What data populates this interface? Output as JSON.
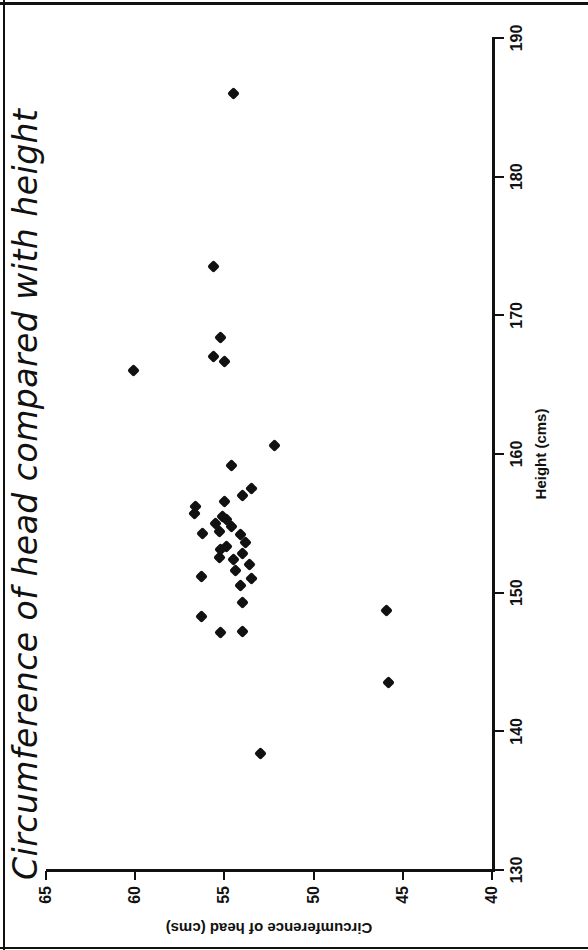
{
  "figure": {
    "title": "Circumference of head compared with height"
  },
  "chart_data": {
    "type": "scatter",
    "title": "Circumference of head compared with height",
    "xlabel": "Height (cms)",
    "ylabel": "Circumference of head (cms)",
    "xlim": [
      130,
      190
    ],
    "ylim": [
      40,
      65
    ],
    "xticks": [
      130,
      140,
      150,
      160,
      170,
      180,
      190
    ],
    "yticks": [
      40,
      45,
      50,
      55,
      60,
      65
    ],
    "grid": false,
    "legend": null,
    "marker": "diamond",
    "marker_color": "#111111",
    "n_points": 37,
    "x": [
      138.4,
      143.5,
      147.1,
      147.2,
      148.3,
      148.7,
      149.3,
      150.5,
      151.0,
      151.2,
      151.6,
      152.0,
      152.4,
      152.5,
      152.8,
      153.1,
      153.3,
      153.6,
      154.2,
      154.3,
      154.4,
      154.8,
      155.0,
      155.3,
      155.5,
      155.7,
      156.2,
      156.6,
      157.0,
      157.5,
      159.2,
      160.6,
      166.0,
      166.7,
      167.0,
      168.4,
      173.5,
      186.0
    ],
    "y": [
      53.0,
      45.8,
      55.2,
      54.0,
      56.3,
      45.9,
      54.0,
      54.1,
      53.5,
      56.3,
      54.4,
      53.6,
      54.5,
      55.3,
      54.0,
      55.2,
      54.9,
      53.8,
      54.1,
      56.2,
      55.3,
      54.6,
      55.5,
      54.9,
      55.1,
      56.7,
      56.6,
      55.0,
      54.0,
      53.5,
      54.6,
      52.2,
      60.1,
      55.0,
      55.6,
      55.2,
      55.6,
      54.5
    ],
    "points": [
      {
        "x": 138.4,
        "y": 53.0
      },
      {
        "x": 143.5,
        "y": 45.8
      },
      {
        "x": 147.1,
        "y": 55.2
      },
      {
        "x": 147.2,
        "y": 54.0
      },
      {
        "x": 148.3,
        "y": 56.3
      },
      {
        "x": 148.7,
        "y": 45.9
      },
      {
        "x": 149.3,
        "y": 54.0
      },
      {
        "x": 150.5,
        "y": 54.1
      },
      {
        "x": 151.0,
        "y": 53.5
      },
      {
        "x": 151.2,
        "y": 56.3
      },
      {
        "x": 151.6,
        "y": 54.4
      },
      {
        "x": 152.0,
        "y": 53.6
      },
      {
        "x": 152.4,
        "y": 54.5
      },
      {
        "x": 152.5,
        "y": 55.3
      },
      {
        "x": 152.8,
        "y": 54.0
      },
      {
        "x": 153.1,
        "y": 55.2
      },
      {
        "x": 153.3,
        "y": 54.9
      },
      {
        "x": 153.6,
        "y": 53.8
      },
      {
        "x": 154.2,
        "y": 54.1
      },
      {
        "x": 154.3,
        "y": 56.2
      },
      {
        "x": 154.4,
        "y": 55.3
      },
      {
        "x": 154.8,
        "y": 54.6
      },
      {
        "x": 155.0,
        "y": 55.5
      },
      {
        "x": 155.3,
        "y": 54.9
      },
      {
        "x": 155.5,
        "y": 55.1
      },
      {
        "x": 155.7,
        "y": 56.7
      },
      {
        "x": 156.2,
        "y": 56.6
      },
      {
        "x": 156.6,
        "y": 55.0
      },
      {
        "x": 157.0,
        "y": 54.0
      },
      {
        "x": 157.5,
        "y": 53.5
      },
      {
        "x": 159.2,
        "y": 54.6
      },
      {
        "x": 160.6,
        "y": 52.2
      },
      {
        "x": 166.0,
        "y": 60.1
      },
      {
        "x": 166.7,
        "y": 55.0
      },
      {
        "x": 167.0,
        "y": 55.6
      },
      {
        "x": 168.4,
        "y": 55.2
      },
      {
        "x": 173.5,
        "y": 55.6
      },
      {
        "x": 186.0,
        "y": 54.5
      }
    ]
  }
}
